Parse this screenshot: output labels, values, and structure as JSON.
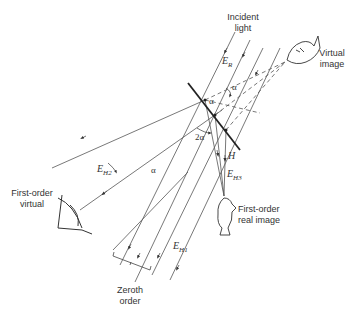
{
  "diagram": {
    "type": "hologram-reconstruction-geometry",
    "labels": {
      "incident_light": "Incident\nlight",
      "incident_light_l1": "Incident",
      "incident_light_l2": "light",
      "virtual_image_l1": "Virtual",
      "virtual_image_l2": "image",
      "first_order_virtual_l1": "First-order",
      "first_order_virtual_l2": "virtual",
      "first_order_real_l1": "First-order",
      "first_order_real_l2": "real image",
      "zeroth_order_l1": "Zeroth",
      "zeroth_order_l2": "order",
      "hologram": "H"
    },
    "symbols": {
      "ER": {
        "base": "E",
        "sub": "R"
      },
      "EH1": {
        "base": "E",
        "sub": "H1"
      },
      "EH2": {
        "base": "E",
        "sub": "H2"
      },
      "EH3": {
        "base": "E",
        "sub": "H3"
      }
    },
    "angles": {
      "alpha_top": "α",
      "alpha_mid": "α",
      "two_alpha": "2α",
      "alpha_left": "α"
    },
    "colors": {
      "line": "#444444",
      "hologram": "#222222",
      "text": "#333333"
    }
  }
}
